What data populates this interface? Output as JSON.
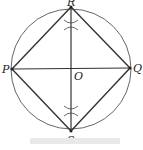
{
  "diagram": {
    "type": "geometry-construction",
    "points": {
      "R": {
        "label": "R",
        "x": 71,
        "y": 7
      },
      "S": {
        "label": "S",
        "x": 71,
        "y": 131
      },
      "P": {
        "label": "P",
        "x": 12,
        "y": 69
      },
      "Q": {
        "label": "Q",
        "x": 130,
        "y": 68
      },
      "O": {
        "label": "O",
        "x": 71,
        "y": 69
      }
    },
    "circle": {
      "cx": 71,
      "cy": 69,
      "r": 60
    },
    "segments": [
      "PR",
      "RQ",
      "QS",
      "SP",
      "PQ",
      "RS"
    ],
    "colors": {
      "line": "#333333",
      "background": "#ffffff"
    }
  }
}
